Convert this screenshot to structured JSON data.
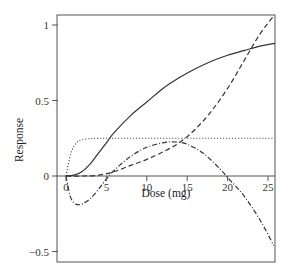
{
  "chart_data": {
    "type": "line",
    "title": "",
    "xlabel": "Dose (mg)",
    "ylabel": "Response",
    "xlim": [
      -1.2,
      26
    ],
    "ylim": [
      -0.55,
      1.07
    ],
    "x_ticks": [
      0,
      5,
      10,
      15,
      20,
      25
    ],
    "x_tick_labels": [
      "0",
      "5",
      "10",
      "15",
      "20",
      "25"
    ],
    "y_ticks": [
      1,
      0.5,
      0,
      -0.5
    ],
    "y_tick_labels": [
      "1",
      "0.5",
      "0",
      "−0.5"
    ],
    "grid": false,
    "legend": "none",
    "zero_line": true,
    "series": [
      {
        "name": "solid",
        "style": "solid",
        "x": [
          0,
          1,
          2,
          3,
          4,
          5,
          6,
          8,
          10,
          12,
          14,
          16,
          18,
          20,
          22,
          24,
          26
        ],
        "y": [
          0,
          0.005,
          0.03,
          0.08,
          0.15,
          0.22,
          0.29,
          0.4,
          0.49,
          0.58,
          0.65,
          0.71,
          0.76,
          0.8,
          0.83,
          0.86,
          0.88
        ]
      },
      {
        "name": "dashed",
        "style": "dashed",
        "x": [
          0,
          2,
          4,
          6,
          8,
          10,
          12,
          14,
          16,
          18,
          20,
          22,
          24,
          25.7
        ],
        "y": [
          0,
          0.0,
          0.005,
          0.03,
          0.07,
          0.11,
          0.16,
          0.22,
          0.31,
          0.43,
          0.58,
          0.76,
          0.94,
          1.06
        ]
      },
      {
        "name": "dotted",
        "style": "dotted",
        "x": [
          0,
          0.3,
          0.6,
          1,
          1.5,
          2,
          3,
          4,
          6,
          10,
          15,
          20,
          25.7
        ],
        "y": [
          0,
          0.08,
          0.15,
          0.2,
          0.23,
          0.24,
          0.248,
          0.25,
          0.25,
          0.25,
          0.25,
          0.25,
          0.25
        ]
      },
      {
        "name": "dash-dot",
        "style": "dashdot",
        "x": [
          0,
          0.5,
          1,
          1.5,
          2,
          3,
          4,
          5,
          6,
          8,
          10,
          12,
          13.5,
          15,
          17,
          19,
          20,
          22,
          24,
          25.7
        ],
        "y": [
          0,
          -0.13,
          -0.18,
          -0.19,
          -0.185,
          -0.15,
          -0.09,
          -0.02,
          0.04,
          0.13,
          0.19,
          0.22,
          0.225,
          0.21,
          0.15,
          0.05,
          -0.01,
          -0.13,
          -0.29,
          -0.46
        ]
      }
    ]
  },
  "layout": {
    "frame": {
      "left": 57,
      "top": 15,
      "right": 275,
      "bottom": 262
    },
    "x_map": {
      "origin_px": 66,
      "px_per_unit": 8.08
    },
    "y_map": {
      "origin_px": 176,
      "px_per_unit": 151
    },
    "line_color": "#333333",
    "axis_color": "#555555"
  }
}
